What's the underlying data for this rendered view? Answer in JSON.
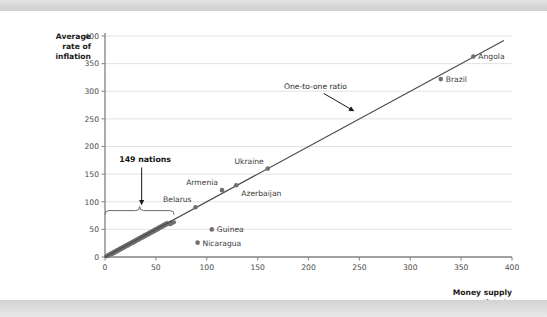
{
  "figure": {
    "background_color": "#ffffff",
    "band_color": "#d8d8d8"
  },
  "chart_data": {
    "type": "scatter",
    "title": "",
    "xlabel": "Money supply growth rate",
    "ylabel": "Average rate of inflation",
    "xlim": [
      0,
      400
    ],
    "ylim": [
      0,
      400
    ],
    "xticks": [
      0,
      50,
      100,
      150,
      200,
      250,
      300,
      350,
      400
    ],
    "xticklabels": [
      "0",
      "50",
      "100",
      "150",
      "200",
      "250",
      "300",
      "350",
      "400"
    ],
    "yticks": [
      0,
      50,
      100,
      150,
      200,
      250,
      300,
      350,
      400
    ],
    "yticklabels": [
      "0",
      "50",
      "100",
      "150",
      "200",
      "250",
      "300",
      "350",
      "400"
    ],
    "grid": "horizontal",
    "grid_color": "#e0e0e0",
    "legend": "none",
    "point_color": "#6f6f6f",
    "line_color": "#4a4a4a",
    "reference_line": {
      "label": "One-to-one ratio",
      "slope": 1,
      "intercept": 0,
      "x": [
        0,
        392
      ],
      "y": [
        0,
        392
      ]
    },
    "labeled_points": [
      {
        "name": "Angola",
        "x": 362,
        "y": 363,
        "label_pos": "right"
      },
      {
        "name": "Brazil",
        "x": 330,
        "y": 322,
        "label_pos": "right"
      },
      {
        "name": "Ukraine",
        "x": 160,
        "y": 160,
        "label_pos": "above-left"
      },
      {
        "name": "Azerbaijan",
        "x": 129,
        "y": 130,
        "label_pos": "below-right"
      },
      {
        "name": "Armenia",
        "x": 115,
        "y": 121,
        "label_pos": "above-left"
      },
      {
        "name": "Belarus",
        "x": 89,
        "y": 90,
        "label_pos": "above-left"
      },
      {
        "name": "Guinea",
        "x": 105,
        "y": 50,
        "label_pos": "right"
      },
      {
        "name": "Nicaragua",
        "x": 91,
        "y": 26,
        "label_pos": "right"
      }
    ],
    "cluster": {
      "description": "149 nations clustered near the origin along the one-to-one line",
      "x_range": [
        0,
        68
      ],
      "y_range": [
        0,
        62
      ],
      "points": [
        [
          1,
          1
        ],
        [
          2,
          1
        ],
        [
          2,
          3
        ],
        [
          3,
          2
        ],
        [
          3,
          4
        ],
        [
          4,
          3
        ],
        [
          4,
          5
        ],
        [
          5,
          4
        ],
        [
          5,
          6
        ],
        [
          6,
          5
        ],
        [
          6,
          7
        ],
        [
          7,
          5
        ],
        [
          7,
          8
        ],
        [
          8,
          6
        ],
        [
          8,
          9
        ],
        [
          9,
          7
        ],
        [
          9,
          10
        ],
        [
          10,
          8
        ],
        [
          10,
          11
        ],
        [
          11,
          9
        ],
        [
          11,
          12
        ],
        [
          12,
          10
        ],
        [
          12,
          13
        ],
        [
          13,
          11
        ],
        [
          13,
          14
        ],
        [
          14,
          12
        ],
        [
          14,
          15
        ],
        [
          15,
          13
        ],
        [
          15,
          16
        ],
        [
          16,
          14
        ],
        [
          16,
          17
        ],
        [
          17,
          15
        ],
        [
          17,
          18
        ],
        [
          18,
          16
        ],
        [
          18,
          19
        ],
        [
          19,
          17
        ],
        [
          19,
          20
        ],
        [
          20,
          18
        ],
        [
          20,
          21
        ],
        [
          21,
          19
        ],
        [
          21,
          22
        ],
        [
          22,
          20
        ],
        [
          22,
          23
        ],
        [
          23,
          21
        ],
        [
          23,
          24
        ],
        [
          24,
          22
        ],
        [
          24,
          25
        ],
        [
          25,
          23
        ],
        [
          25,
          26
        ],
        [
          26,
          24
        ],
        [
          26,
          27
        ],
        [
          27,
          25
        ],
        [
          27,
          28
        ],
        [
          28,
          26
        ],
        [
          28,
          29
        ],
        [
          29,
          27
        ],
        [
          29,
          30
        ],
        [
          30,
          28
        ],
        [
          30,
          31
        ],
        [
          31,
          29
        ],
        [
          31,
          32
        ],
        [
          32,
          30
        ],
        [
          32,
          33
        ],
        [
          33,
          31
        ],
        [
          33,
          34
        ],
        [
          34,
          32
        ],
        [
          34,
          35
        ],
        [
          35,
          33
        ],
        [
          35,
          36
        ],
        [
          36,
          34
        ],
        [
          36,
          37
        ],
        [
          37,
          35
        ],
        [
          37,
          38
        ],
        [
          38,
          36
        ],
        [
          38,
          39
        ],
        [
          39,
          37
        ],
        [
          39,
          40
        ],
        [
          40,
          38
        ],
        [
          40,
          41
        ],
        [
          41,
          39
        ],
        [
          41,
          42
        ],
        [
          42,
          40
        ],
        [
          42,
          43
        ],
        [
          43,
          41
        ],
        [
          43,
          44
        ],
        [
          44,
          42
        ],
        [
          44,
          45
        ],
        [
          45,
          43
        ],
        [
          45,
          46
        ],
        [
          46,
          44
        ],
        [
          46,
          47
        ],
        [
          47,
          45
        ],
        [
          47,
          48
        ],
        [
          48,
          46
        ],
        [
          48,
          49
        ],
        [
          49,
          47
        ],
        [
          49,
          50
        ],
        [
          50,
          48
        ],
        [
          50,
          51
        ],
        [
          51,
          49
        ],
        [
          51,
          52
        ],
        [
          52,
          50
        ],
        [
          52,
          53
        ],
        [
          53,
          51
        ],
        [
          53,
          54
        ],
        [
          54,
          52
        ],
        [
          54,
          55
        ],
        [
          55,
          53
        ],
        [
          55,
          56
        ],
        [
          56,
          54
        ],
        [
          56,
          57
        ],
        [
          57,
          55
        ],
        [
          57,
          58
        ],
        [
          58,
          56
        ],
        [
          58,
          59
        ],
        [
          59,
          57
        ],
        [
          59,
          60
        ],
        [
          60,
          58
        ],
        [
          60,
          61
        ],
        [
          61,
          59
        ],
        [
          61,
          62
        ],
        [
          62,
          60
        ],
        [
          63,
          61
        ],
        [
          64,
          59
        ],
        [
          64,
          62
        ],
        [
          65,
          60
        ],
        [
          65,
          63
        ],
        [
          66,
          61
        ],
        [
          67,
          62
        ],
        [
          68,
          63
        ],
        [
          2,
          2
        ],
        [
          4,
          4
        ],
        [
          6,
          6
        ],
        [
          8,
          8
        ],
        [
          10,
          10
        ],
        [
          12,
          12
        ],
        [
          14,
          14
        ],
        [
          16,
          16
        ],
        [
          18,
          18
        ],
        [
          20,
          20
        ],
        [
          22,
          22
        ],
        [
          24,
          24
        ],
        [
          26,
          26
        ],
        [
          28,
          28
        ],
        [
          30,
          30
        ],
        [
          33,
          33
        ],
        [
          36,
          36
        ],
        [
          39,
          39
        ],
        [
          42,
          42
        ],
        [
          48,
          48
        ]
      ]
    },
    "annotations": [
      {
        "id": "nations-annotation",
        "text": "149 nations",
        "bold": true,
        "text_x": 14,
        "text_y": 172,
        "arrow_from": [
          36,
          162
        ],
        "arrow_to": [
          36,
          98
        ],
        "brace": {
          "x_from": 0,
          "x_to": 68,
          "y": 84
        }
      },
      {
        "id": "ratio-annotation",
        "text": "One-to-one ratio",
        "bold": false,
        "text_x": 176,
        "text_y": 304,
        "arrow_from": [
          215,
          296
        ],
        "arrow_to": [
          243,
          266
        ]
      }
    ]
  }
}
